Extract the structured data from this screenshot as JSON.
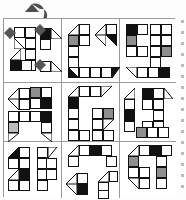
{
  "figure": {
    "kind": "puzzle-grid-figure",
    "columns": 3,
    "rows": 3,
    "cell_fill_colors": {
      "empty": "#ffffff",
      "gray": "#8e8e8e",
      "light_gray": "#bdbdbd",
      "black": "#111111",
      "outline": "#111111",
      "panel_border": "#9a9a9a"
    },
    "overlay": {
      "name": "brush-stroke-arrow",
      "color": "#4a4a4a",
      "in_panel": 1,
      "markers": [
        "arrow-marker-left",
        "arrow-marker-top-right",
        "arrow-marker-bottom-right"
      ]
    },
    "panels": [
      {
        "id": "panel-1",
        "position": "row1-col1",
        "label": "",
        "shapes": [
          {
            "name": "stair-shape-upper",
            "cells": [
              {
                "x": 10,
                "y": 10,
                "fill": "empty"
              },
              {
                "x": 20,
                "y": 10,
                "fill": "empty"
              },
              {
                "x": 10,
                "y": 20,
                "fill": "empty"
              },
              {
                "x": 30,
                "y": 14,
                "fill": "black"
              },
              {
                "x": 40,
                "y": 14,
                "fill": "empty"
              }
            ]
          },
          {
            "name": "ladder-shape-center",
            "cells": [
              {
                "x": 22,
                "y": 22,
                "fill": "empty"
              },
              {
                "x": 22,
                "y": 32,
                "fill": "empty"
              },
              {
                "x": 22,
                "y": 42,
                "fill": "empty"
              }
            ]
          },
          {
            "name": "block-shape-lower",
            "cells": [
              {
                "x": 6,
                "y": 42,
                "fill": "black"
              },
              {
                "x": 16,
                "y": 42,
                "fill": "empty"
              },
              {
                "x": 34,
                "y": 44,
                "fill": "empty"
              },
              {
                "x": 44,
                "y": 44,
                "fill": "empty"
              }
            ]
          }
        ]
      },
      {
        "id": "panel-2",
        "position": "row1-col2",
        "label": "",
        "shapes": [
          {
            "name": "c-shape-large",
            "cells": [
              {
                "x": 6,
                "y": 6,
                "fill": "empty"
              },
              {
                "x": 16,
                "y": 6,
                "fill": "empty"
              },
              {
                "x": 6,
                "y": 16,
                "fill": "gray"
              },
              {
                "x": 16,
                "y": 16,
                "fill": "empty"
              },
              {
                "x": 6,
                "y": 26,
                "fill": "empty"
              },
              {
                "x": 6,
                "y": 36,
                "fill": "empty"
              },
              {
                "x": 6,
                "y": 46,
                "fill": "empty"
              },
              {
                "x": 16,
                "y": 46,
                "fill": "empty"
              },
              {
                "x": 26,
                "y": 46,
                "fill": "empty"
              },
              {
                "x": 36,
                "y": 46,
                "fill": "empty"
              },
              {
                "x": 46,
                "y": 46,
                "fill": "empty"
              }
            ]
          },
          {
            "name": "small-hook-shape",
            "cells": [
              {
                "x": 30,
                "y": 6,
                "fill": "empty"
              },
              {
                "x": 40,
                "y": 6,
                "fill": "empty"
              },
              {
                "x": 30,
                "y": 16,
                "fill": "empty"
              },
              {
                "x": 40,
                "y": 16,
                "fill": "black"
              }
            ]
          }
        ]
      },
      {
        "id": "panel-3",
        "position": "row1-col3",
        "label": "",
        "shapes": [
          {
            "name": "c-letter-shape",
            "cells": [
              {
                "x": 6,
                "y": 6,
                "fill": "black"
              },
              {
                "x": 6,
                "y": 16,
                "fill": "gray"
              },
              {
                "x": 6,
                "y": 26,
                "fill": "empty"
              },
              {
                "x": 6,
                "y": 36,
                "fill": "empty"
              }
            ]
          },
          {
            "name": "s-letter-shape",
            "cells": [
              {
                "x": 22,
                "y": 6,
                "fill": "empty"
              },
              {
                "x": 32,
                "y": 6,
                "fill": "empty"
              },
              {
                "x": 22,
                "y": 16,
                "fill": "empty"
              },
              {
                "x": 32,
                "y": 16,
                "fill": "empty"
              },
              {
                "x": 22,
                "y": 26,
                "fill": "empty"
              },
              {
                "x": 32,
                "y": 26,
                "fill": "empty"
              }
            ]
          },
          {
            "name": "bottom-bar-shape",
            "cells": [
              {
                "x": 6,
                "y": 44,
                "fill": "empty"
              },
              {
                "x": 16,
                "y": 44,
                "fill": "empty"
              },
              {
                "x": 26,
                "y": 44,
                "fill": "empty"
              },
              {
                "x": 36,
                "y": 44,
                "fill": "black"
              }
            ]
          }
        ]
      },
      {
        "id": "panel-4",
        "position": "row2-col1",
        "label": "",
        "shapes": [
          {
            "name": "zigzag-shape-upper",
            "cells": [
              {
                "x": 4,
                "y": 6,
                "fill": "empty"
              },
              {
                "x": 14,
                "y": 6,
                "fill": "empty"
              },
              {
                "x": 24,
                "y": 4,
                "fill": "gray"
              },
              {
                "x": 34,
                "y": 4,
                "fill": "empty"
              },
              {
                "x": 34,
                "y": 14,
                "fill": "black"
              }
            ]
          },
          {
            "name": "bar-shape-lower",
            "cells": [
              {
                "x": 4,
                "y": 26,
                "fill": "light_gray"
              },
              {
                "x": 14,
                "y": 26,
                "fill": "empty"
              },
              {
                "x": 24,
                "y": 26,
                "fill": "empty"
              },
              {
                "x": 34,
                "y": 26,
                "fill": "black"
              },
              {
                "x": 34,
                "y": 36,
                "fill": "empty"
              }
            ]
          }
        ]
      },
      {
        "id": "panel-5",
        "position": "row2-col2",
        "label": "",
        "shapes": [
          {
            "name": "big-c-shape",
            "cells": [
              {
                "x": 6,
                "y": 4,
                "fill": "empty"
              },
              {
                "x": 16,
                "y": 4,
                "fill": "empty"
              },
              {
                "x": 26,
                "y": 4,
                "fill": "empty"
              },
              {
                "x": 6,
                "y": 14,
                "fill": "black"
              },
              {
                "x": 6,
                "y": 24,
                "fill": "empty"
              },
              {
                "x": 6,
                "y": 34,
                "fill": "empty"
              },
              {
                "x": 6,
                "y": 44,
                "fill": "empty"
              },
              {
                "x": 16,
                "y": 44,
                "fill": "empty"
              }
            ]
          },
          {
            "name": "small-s-shape",
            "cells": [
              {
                "x": 30,
                "y": 24,
                "fill": "empty"
              },
              {
                "x": 40,
                "y": 24,
                "fill": "gray"
              },
              {
                "x": 30,
                "y": 34,
                "fill": "empty"
              },
              {
                "x": 40,
                "y": 34,
                "fill": "empty"
              }
            ]
          }
        ]
      },
      {
        "id": "panel-6",
        "position": "row2-col3",
        "label": "",
        "shapes": [
          {
            "name": "left-bracket-shape",
            "cells": [
              {
                "x": 4,
                "y": 6,
                "fill": "empty"
              },
              {
                "x": 4,
                "y": 16,
                "fill": "empty"
              },
              {
                "x": 4,
                "y": 26,
                "fill": "black"
              },
              {
                "x": 4,
                "y": 36,
                "fill": "empty"
              }
            ]
          },
          {
            "name": "g-shape-right",
            "cells": [
              {
                "x": 22,
                "y": 6,
                "fill": "black"
              },
              {
                "x": 32,
                "y": 6,
                "fill": "empty"
              },
              {
                "x": 22,
                "y": 16,
                "fill": "empty"
              },
              {
                "x": 32,
                "y": 16,
                "fill": "empty"
              },
              {
                "x": 22,
                "y": 36,
                "fill": "gray"
              },
              {
                "x": 32,
                "y": 36,
                "fill": "empty"
              }
            ]
          }
        ]
      },
      {
        "id": "panel-7",
        "position": "row3-col1",
        "label": "",
        "shapes": [
          {
            "name": "j-shape-left",
            "cells": [
              {
                "x": 4,
                "y": 6,
                "fill": "empty"
              },
              {
                "x": 14,
                "y": 6,
                "fill": "empty"
              },
              {
                "x": 14,
                "y": 16,
                "fill": "empty"
              },
              {
                "x": 14,
                "y": 26,
                "fill": "black"
              },
              {
                "x": 4,
                "y": 36,
                "fill": "empty"
              },
              {
                "x": 14,
                "y": 36,
                "fill": "empty"
              }
            ]
          },
          {
            "name": "s-shape-right",
            "cells": [
              {
                "x": 32,
                "y": 6,
                "fill": "empty"
              },
              {
                "x": 32,
                "y": 16,
                "fill": "empty"
              },
              {
                "x": 32,
                "y": 26,
                "fill": "empty"
              },
              {
                "x": 32,
                "y": 36,
                "fill": "empty"
              }
            ]
          }
        ]
      },
      {
        "id": "panel-8",
        "position": "row3-col2",
        "label": "",
        "shapes": [
          {
            "name": "arch-shape-top",
            "cells": [
              {
                "x": 6,
                "y": 4,
                "fill": "empty"
              },
              {
                "x": 16,
                "y": 4,
                "fill": "empty"
              },
              {
                "x": 26,
                "y": 4,
                "fill": "black"
              },
              {
                "x": 36,
                "y": 4,
                "fill": "empty"
              },
              {
                "x": 6,
                "y": 14,
                "fill": "empty"
              },
              {
                "x": 44,
                "y": 14,
                "fill": "empty"
              }
            ]
          },
          {
            "name": "v-shape-bottom-left",
            "cells": [
              {
                "x": 6,
                "y": 32,
                "fill": "empty"
              },
              {
                "x": 16,
                "y": 32,
                "fill": "empty"
              },
              {
                "x": 16,
                "y": 42,
                "fill": "black"
              }
            ]
          },
          {
            "name": "hook-shape-bottom-right",
            "cells": [
              {
                "x": 38,
                "y": 30,
                "fill": "empty"
              },
              {
                "x": 38,
                "y": 40,
                "fill": "empty"
              }
            ]
          }
        ]
      },
      {
        "id": "panel-9",
        "position": "row3-col3",
        "label": "",
        "shapes": [
          {
            "name": "s-shape-big",
            "cells": [
              {
                "x": 8,
                "y": 4,
                "fill": "empty"
              },
              {
                "x": 18,
                "y": 4,
                "fill": "black"
              },
              {
                "x": 28,
                "y": 4,
                "fill": "empty"
              },
              {
                "x": 8,
                "y": 14,
                "fill": "gray"
              },
              {
                "x": 8,
                "y": 24,
                "fill": "empty"
              },
              {
                "x": 18,
                "y": 24,
                "fill": "empty"
              },
              {
                "x": 18,
                "y": 34,
                "fill": "empty"
              }
            ]
          },
          {
            "name": "j-shape-right",
            "cells": [
              {
                "x": 36,
                "y": 14,
                "fill": "empty"
              },
              {
                "x": 36,
                "y": 24,
                "fill": "gray"
              }
            ]
          }
        ]
      }
    ]
  }
}
